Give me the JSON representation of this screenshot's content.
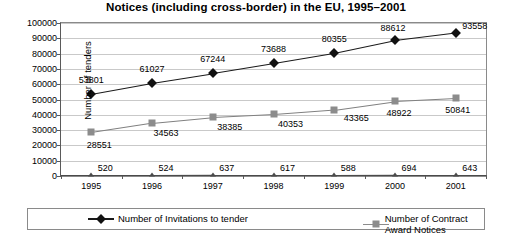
{
  "chart_data": {
    "type": "line",
    "title": "Notices (including cross-border) in the EU, 1995–2001",
    "xlabel": "",
    "ylabel": "Number of tenders",
    "ylim": [
      0,
      100000
    ],
    "ytick_step": 10000,
    "yticks": [
      "0",
      "10000",
      "20000",
      "30000",
      "40000",
      "50000",
      "60000",
      "70000",
      "80000",
      "90000",
      "100000"
    ],
    "categories": [
      "1995",
      "1996",
      "1997",
      "1998",
      "1999",
      "2000",
      "2001"
    ],
    "grid": true,
    "legend_position": "bottom",
    "series": [
      {
        "name": "Number of Invitations to tender",
        "marker": "diamond",
        "color": "#1a1a1a",
        "in_legend": true,
        "values": [
          53801,
          61027,
          67244,
          73688,
          80355,
          88612,
          93558
        ],
        "labels": [
          "53801",
          "61027",
          "67244",
          "73688",
          "80355",
          "88612",
          "93558"
        ]
      },
      {
        "name": "Number of Contract Award Notices",
        "marker": "square",
        "color": "#8c8c8c",
        "in_legend": true,
        "values": [
          28551,
          34563,
          38385,
          40353,
          43365,
          48922,
          50841
        ],
        "labels": [
          "28551",
          "34563",
          "38385",
          "40353",
          "43365",
          "48922",
          "50841"
        ]
      },
      {
        "name": "",
        "marker": "triangle",
        "color": "#4a4a4a",
        "in_legend": false,
        "values": [
          520,
          524,
          637,
          617,
          588,
          694,
          643
        ],
        "labels": [
          "520",
          "524",
          "637",
          "617",
          "588",
          "694",
          "643"
        ]
      }
    ]
  }
}
